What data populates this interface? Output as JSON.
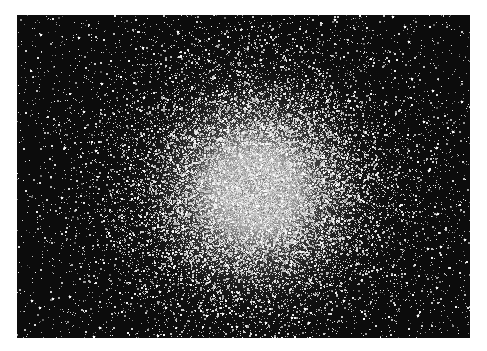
{
  "image": {
    "subject": "globular star cluster",
    "description": "Black-and-white astronomical photograph of a dense globular star cluster with a bright white core fading into scattered stars against a black sky",
    "colors": {
      "sky": "#0c0c0c",
      "star": "#ffffff",
      "core": "#f4f4f4",
      "page_background": "#ffffff"
    }
  }
}
